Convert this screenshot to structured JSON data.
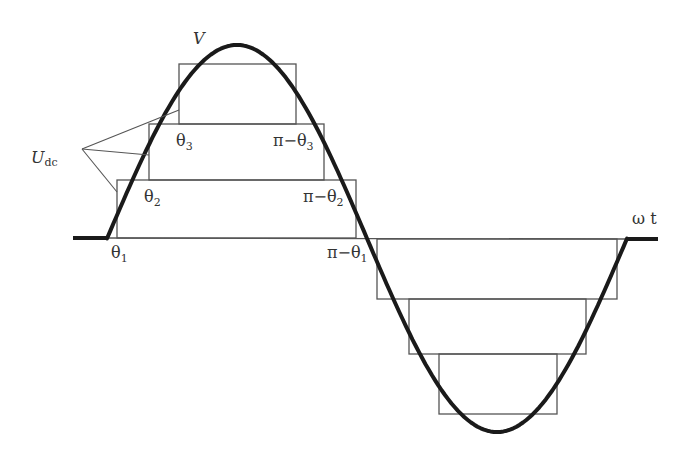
{
  "diagram": {
    "wave_label": "V",
    "axis_label": "ω t",
    "dc_label": {
      "main": "U",
      "sub": "dc"
    },
    "angle_labels": [
      {
        "id": "theta1",
        "main": "θ",
        "sub": "1"
      },
      {
        "id": "theta2",
        "main": "θ",
        "sub": "2"
      },
      {
        "id": "theta3",
        "main": "θ",
        "sub": "3"
      },
      {
        "id": "pi-theta3",
        "main": "π−θ",
        "sub": "3"
      },
      {
        "id": "pi-theta2",
        "main": "π−θ",
        "sub": "2"
      },
      {
        "id": "pi-theta1",
        "main": "π−θ",
        "sub": "1"
      }
    ],
    "levels": 3,
    "colors": {
      "wave": "#1a1a1a",
      "boxes": "#555555",
      "text": "#333333",
      "background": "#ffffff"
    }
  }
}
